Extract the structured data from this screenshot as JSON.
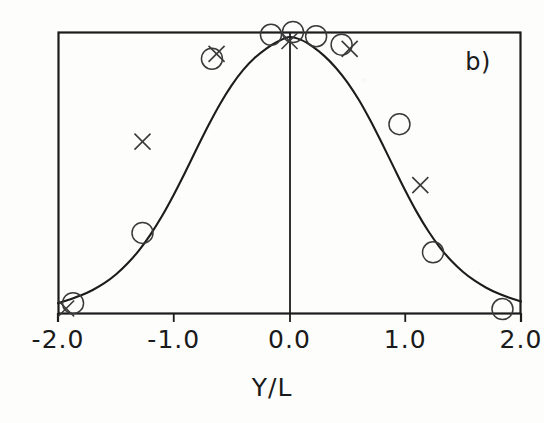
{
  "figure": {
    "panel_label": "b)",
    "background_color": "#fdfdfc",
    "ink_color": "#1c1c1c"
  },
  "axis": {
    "xlabel": "Y/L",
    "tick_labels": [
      "-2.0",
      "-1.0",
      "0.0",
      "1.0",
      "2.0"
    ]
  },
  "chart_data": {
    "type": "line",
    "title": "",
    "subtitle": "",
    "panel": "b)",
    "xlabel": "Y/L",
    "ylabel": "",
    "xlim": [
      -2.0,
      2.0
    ],
    "ylim": [
      0.0,
      1.0
    ],
    "xticks": [
      -2.0,
      -1.0,
      0.0,
      1.0,
      2.0
    ],
    "xticklabels": [
      "-2.0",
      "-1.0",
      "0.0",
      "1.0",
      "2.0"
    ],
    "yticks": [],
    "yticklabels": [],
    "grid": false,
    "legend": null,
    "annotations": [
      {
        "text": "b)",
        "x": 1.55,
        "y": 0.88
      }
    ],
    "series": [
      {
        "name": "model-curve",
        "type": "line",
        "style": "solid",
        "color": "#1c1c1c",
        "x": [
          -2.0,
          -1.9,
          -1.8,
          -1.7,
          -1.6,
          -1.5,
          -1.4,
          -1.3,
          -1.2,
          -1.1,
          -1.0,
          -0.9,
          -0.8,
          -0.7,
          -0.6,
          -0.5,
          -0.4,
          -0.3,
          -0.2,
          -0.1,
          0.0,
          0.1,
          0.2,
          0.3,
          0.4,
          0.5,
          0.6,
          0.7,
          0.8,
          0.9,
          1.0,
          1.1,
          1.2,
          1.3,
          1.4,
          1.5,
          1.6,
          1.7,
          1.8,
          1.9,
          2.0
        ],
        "y": [
          0.035,
          0.048,
          0.063,
          0.082,
          0.106,
          0.137,
          0.176,
          0.223,
          0.28,
          0.346,
          0.421,
          0.502,
          0.586,
          0.668,
          0.744,
          0.81,
          0.865,
          0.908,
          0.941,
          0.966,
          0.982,
          0.972,
          0.948,
          0.915,
          0.873,
          0.821,
          0.758,
          0.684,
          0.603,
          0.519,
          0.436,
          0.359,
          0.291,
          0.233,
          0.185,
          0.146,
          0.115,
          0.09,
          0.07,
          0.054,
          0.041
        ]
      },
      {
        "name": "experiment-circles",
        "type": "scatter",
        "marker": "open-circle",
        "color": "#333333",
        "points": [
          {
            "x": -1.87,
            "y": 0.035
          },
          {
            "x": -1.27,
            "y": 0.285
          },
          {
            "x": -0.67,
            "y": 0.905
          },
          {
            "x": -0.16,
            "y": 0.99
          },
          {
            "x": 0.03,
            "y": 1.0
          },
          {
            "x": 0.23,
            "y": 0.985
          },
          {
            "x": 0.45,
            "y": 0.955
          },
          {
            "x": 0.95,
            "y": 0.672
          },
          {
            "x": 1.24,
            "y": 0.216
          },
          {
            "x": 1.84,
            "y": 0.014
          }
        ]
      },
      {
        "name": "experiment-crosses",
        "type": "scatter",
        "marker": "cross",
        "color": "#333333",
        "points": [
          {
            "x": -1.93,
            "y": 0.016
          },
          {
            "x": -1.27,
            "y": 0.61
          },
          {
            "x": -0.63,
            "y": 0.922
          },
          {
            "x": 0.0,
            "y": 0.968
          },
          {
            "x": 0.52,
            "y": 0.94
          },
          {
            "x": 1.13,
            "y": 0.455
          }
        ]
      }
    ]
  }
}
